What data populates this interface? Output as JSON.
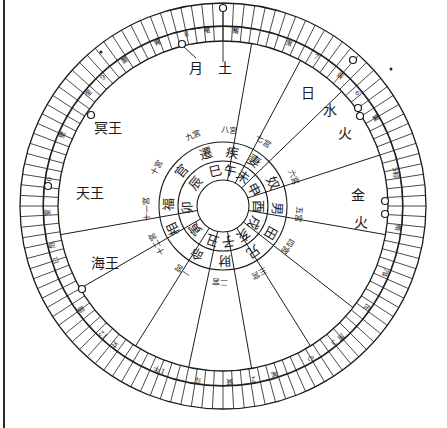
{
  "chart": {
    "center": [
      223,
      206
    ],
    "radii": {
      "inner_circle": 26,
      "branch_ring": 45,
      "house_ring": 64,
      "zodiac_inner": 165,
      "zodiac_mid": 180,
      "zodiac_outer": 203
    },
    "outer_ticks": 120,
    "line_color": "#1c1c1c",
    "house_cusp_angles_deg": [
      -80,
      -62,
      -44,
      -18,
      10,
      38,
      58,
      80,
      102,
      122,
      150,
      170
    ]
  },
  "earthly_branches": [
    {
      "label": "巳",
      "angle": -103
    },
    {
      "label": "午",
      "angle": -78
    },
    {
      "label": "未",
      "angle": -55
    },
    {
      "label": "申",
      "angle": -28
    },
    {
      "label": "酉",
      "angle": 0
    },
    {
      "label": "戌",
      "angle": 28
    },
    {
      "label": "亥",
      "angle": 55
    },
    {
      "label": "子",
      "angle": 82
    },
    {
      "label": "丑",
      "angle": 108
    },
    {
      "label": "寅",
      "angle": 140
    },
    {
      "label": "卯",
      "angle": 178
    },
    {
      "label": "辰",
      "angle": -140
    }
  ],
  "houses": [
    {
      "label": "遷",
      "angle": -108
    },
    {
      "label": "疾",
      "angle": -80
    },
    {
      "label": "妻",
      "angle": -55
    },
    {
      "label": "奴",
      "angle": -25
    },
    {
      "label": "男",
      "angle": 3
    },
    {
      "label": "田",
      "angle": 30
    },
    {
      "label": "兄",
      "angle": 56
    },
    {
      "label": "財",
      "angle": 88
    },
    {
      "label": "命",
      "angle": 118
    },
    {
      "label": "相",
      "angle": 155
    },
    {
      "label": "福",
      "angle": -178
    },
    {
      "label": "官",
      "angle": -140
    }
  ],
  "house_notes": [
    {
      "label": "九宮",
      "angle": -113
    },
    {
      "label": "八宮",
      "angle": -85
    },
    {
      "label": "七宮",
      "angle": -58
    },
    {
      "label": "六宮",
      "angle": -22
    },
    {
      "label": "五宮",
      "angle": 6
    },
    {
      "label": "四宮",
      "angle": 32
    },
    {
      "label": "三宮",
      "angle": 62
    },
    {
      "label": "二宮",
      "angle": 92
    },
    {
      "label": "一宮",
      "angle": 122
    },
    {
      "label": "十二宮",
      "angle": 150
    },
    {
      "label": "十一宮",
      "angle": 178
    },
    {
      "label": "十宮",
      "angle": -150
    }
  ],
  "planets": [
    {
      "label": "土",
      "x": 225,
      "y": 68
    },
    {
      "label": "月",
      "x": 196,
      "y": 68
    },
    {
      "label": "水",
      "x": 330,
      "y": 110
    },
    {
      "label": "火",
      "x": 345,
      "y": 133
    },
    {
      "label": "金",
      "x": 358,
      "y": 195
    },
    {
      "label": "火",
      "x": 361,
      "y": 222
    },
    {
      "label": "冥王",
      "x": 108,
      "y": 128
    },
    {
      "label": "天王",
      "x": 90,
      "y": 193
    },
    {
      "label": "海王",
      "x": 105,
      "y": 263
    },
    {
      "label": "日",
      "x": 308,
      "y": 93
    }
  ],
  "planet_markers": [
    {
      "x": 223,
      "y": 8
    },
    {
      "x": 182,
      "y": 44
    },
    {
      "x": 353,
      "y": 60
    },
    {
      "x": 358,
      "y": 108
    },
    {
      "x": 360,
      "y": 116
    },
    {
      "x": 385,
      "y": 201
    },
    {
      "x": 385,
      "y": 214
    },
    {
      "x": 48,
      "y": 186
    },
    {
      "x": 91,
      "y": 115
    },
    {
      "x": 82,
      "y": 289
    }
  ],
  "zodiac_labels": [
    {
      "label": "觜",
      "angle": -86
    },
    {
      "label": "鬼",
      "angle": -68
    },
    {
      "label": "星",
      "angle": -95
    },
    {
      "label": "7",
      "angle": -58
    },
    {
      "label": "張",
      "angle": -48
    },
    {
      "label": "6",
      "angle": -40
    },
    {
      "label": "翼",
      "angle": -30
    },
    {
      "label": "5",
      "angle": -12
    },
    {
      "label": "軫",
      "angle": -10
    },
    {
      "label": "角",
      "angle": 7
    },
    {
      "label": "亢",
      "angle": 22
    },
    {
      "label": "4",
      "angle": 23
    },
    {
      "label": "氐",
      "angle": 35
    },
    {
      "label": "房",
      "angle": 48
    },
    {
      "label": "3",
      "angle": 51
    },
    {
      "label": "心",
      "angle": 60
    },
    {
      "label": "尾",
      "angle": 73
    },
    {
      "label": "2",
      "angle": 80
    },
    {
      "label": "箕",
      "angle": 88
    },
    {
      "label": "斗",
      "angle": 98
    },
    {
      "label": "1",
      "angle": 110
    },
    {
      "label": "牛",
      "angle": 112
    },
    {
      "label": "女",
      "angle": 128
    },
    {
      "label": "12",
      "angle": 133
    },
    {
      "label": "虛",
      "angle": 144
    },
    {
      "label": "11",
      "angle": 162
    },
    {
      "label": "危",
      "angle": 167
    },
    {
      "label": "室",
      "angle": 178
    },
    {
      "label": "10",
      "angle": -172
    },
    {
      "label": "壁",
      "angle": -156
    },
    {
      "label": "奎",
      "angle": -140
    },
    {
      "label": "9",
      "angle": -133
    },
    {
      "label": "婁",
      "angle": -124
    },
    {
      "label": "胃",
      "angle": -112
    },
    {
      "label": "8",
      "angle": -102
    }
  ],
  "marks": [
    {
      "x": 101,
      "y": 52
    },
    {
      "x": 391,
      "y": 69
    }
  ]
}
